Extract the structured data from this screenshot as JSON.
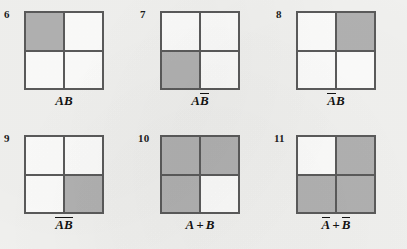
{
  "page": {
    "background_color": "#f2f2f0",
    "ink_color": "#121212",
    "shade_color": "#b2b2b2",
    "unshaded_color": "#fdfdfc",
    "rule_color": "#5b5b5b",
    "layout": "2 rows x 3 columns of two-variable Venn/Karnaugh squares"
  },
  "figures": [
    {
      "index": "6",
      "caption_plain": "AB",
      "caption_parts": [
        {
          "text": "A",
          "overline": false
        },
        {
          "text": "B",
          "overline": false
        }
      ],
      "shaded": {
        "top_left": true,
        "top_right": false,
        "bottom_left": false,
        "bottom_right": false
      },
      "shaded_count": 1
    },
    {
      "index": "7",
      "caption_plain": "AB̄",
      "caption_parts": [
        {
          "text": "A",
          "overline": false
        },
        {
          "text": "B",
          "overline": true
        }
      ],
      "shaded": {
        "top_left": false,
        "top_right": false,
        "bottom_left": true,
        "bottom_right": false
      },
      "shaded_count": 1
    },
    {
      "index": "8",
      "caption_plain": "ĀB",
      "caption_parts": [
        {
          "text": "A",
          "overline": true
        },
        {
          "text": "B",
          "overline": false
        }
      ],
      "shaded": {
        "top_left": false,
        "top_right": true,
        "bottom_left": false,
        "bottom_right": false
      },
      "shaded_count": 1
    },
    {
      "index": "9",
      "caption_plain": "ĀB̄",
      "caption_parts": [
        {
          "text": "A",
          "overline": true
        },
        {
          "text": "B",
          "overline": true
        }
      ],
      "shaded": {
        "top_left": false,
        "top_right": false,
        "bottom_left": false,
        "bottom_right": true
      },
      "shaded_count": 1
    },
    {
      "index": "10",
      "caption_plain": "A + B",
      "caption_parts": [
        {
          "text": "A",
          "overline": false
        },
        {
          "text": "+",
          "operator": true
        },
        {
          "text": "B",
          "overline": false
        }
      ],
      "shaded": {
        "top_left": true,
        "top_right": true,
        "bottom_left": true,
        "bottom_right": false
      },
      "shaded_count": 3
    },
    {
      "index": "11",
      "caption_plain": "Ā + B̄",
      "caption_parts": [
        {
          "text": "A",
          "overline": true
        },
        {
          "text": "+",
          "operator": true
        },
        {
          "text": "B",
          "overline": true
        }
      ],
      "shaded": {
        "top_left": false,
        "top_right": true,
        "bottom_left": true,
        "bottom_right": true
      },
      "shaded_count": 3
    }
  ]
}
